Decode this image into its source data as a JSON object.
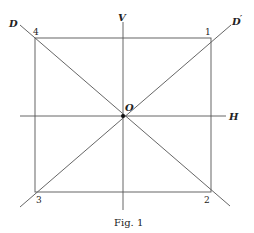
{
  "figure": {
    "caption": "Fig. 1",
    "labels": {
      "vertical": "V",
      "horizontal": "H",
      "diagonal": "D",
      "diagonal_prime": "D",
      "prime_mark": "′",
      "origin": "O"
    },
    "corners": {
      "top_right": "1",
      "bottom_right": "2",
      "bottom_left": "3",
      "top_left": "4"
    }
  }
}
